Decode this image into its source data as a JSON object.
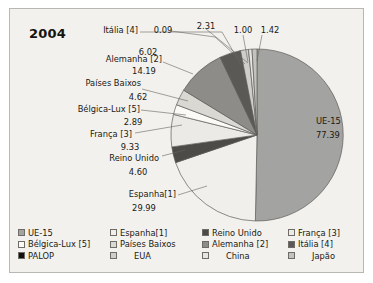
{
  "chart": {
    "title": "2004",
    "background_color": "#f2f1ed",
    "border_color": "#b9b7b2"
  },
  "chart_data": {
    "type": "pie",
    "title": "2004",
    "subtitle": "",
    "xlabel": "",
    "ylabel": "",
    "value_unit": "percent",
    "legend_position": "bottom",
    "grid": false,
    "categories": [
      "UE-15",
      "Espanha[1]",
      "Reino Unido",
      "França [3]",
      "Bélgica-Lux [5]",
      "Países Baixos",
      "Alemanha [2]",
      "Itália [4]",
      "PALOP",
      "EUA",
      "China",
      "Japão"
    ],
    "values": [
      77.39,
      29.99,
      4.6,
      9.33,
      2.89,
      4.62,
      14.19,
      6.02,
      0.09,
      2.31,
      1.0,
      1.42
    ],
    "labels": [
      {
        "name": "UE-15",
        "value": "77.39"
      },
      {
        "name": "Espanha[1]",
        "value": "29.99"
      },
      {
        "name": "Reino Unido",
        "value": "4.60"
      },
      {
        "name": "França [3]",
        "value": "9.33"
      },
      {
        "name": "Bélgica-Lux [5]",
        "value": "2.89"
      },
      {
        "name": "Países Baixos",
        "value": "4.62"
      },
      {
        "name": "Alemanha [2]",
        "value": "14.19"
      },
      {
        "name": "Itália [4]",
        "value": "6.02"
      },
      {
        "name": "PALOP",
        "value": "0.09"
      },
      {
        "name": "EUA",
        "value": "2.31"
      },
      {
        "name": "China",
        "value": "1.00"
      },
      {
        "name": "Japão",
        "value": "1.42"
      }
    ],
    "colors": {
      "UE-15": "#a3a3a1",
      "Espanha[1]": "#f0efeb",
      "Reino Unido": "#4c4b48",
      "França [3]": "#eceae6",
      "Bélgica-Lux [5]": "#fbfaf7",
      "Países Baixos": "#d9d8d3",
      "Alemanha [2]": "#8d8c89",
      "Itália [4]": "#5a5956",
      "PALOP": "#111111",
      "EUA": "#cfcecb",
      "China": "#e6e5e1",
      "Japão": "#c3c2be"
    }
  },
  "callouts": {
    "ue15": {
      "name": "UE-15",
      "value": "77.39"
    },
    "espanha": {
      "name": "Espanha[1]",
      "value": "29.99"
    },
    "reino_unido": {
      "name": "Reino Unido",
      "value": "4.60"
    },
    "franca": {
      "name": "França [3]",
      "value": "9.33"
    },
    "belgica": {
      "name": "Bélgica-Lux [5]",
      "value": "2.89"
    },
    "paises": {
      "name": "Países Baixos",
      "value": "4.62"
    },
    "alemanha": {
      "name": "Alemanha [2]",
      "value": "14.19"
    },
    "italia": {
      "name": "Itália [4]",
      "value": "6.02"
    },
    "palop": {
      "value": "0.09"
    },
    "eua": {
      "value": "2.31"
    },
    "china": {
      "value": "1.00"
    },
    "japao": {
      "value": "1.42"
    }
  },
  "legend": {
    "columns": [
      {
        "items": [
          {
            "label": "UE-15",
            "color": "#a3a3a1",
            "indent": false
          },
          {
            "label": "Bélgica-Lux [5]",
            "color": "#fbfaf7",
            "indent": false
          },
          {
            "label": "PALOP",
            "color": "#111111",
            "indent": false
          }
        ]
      },
      {
        "items": [
          {
            "label": "Espanha[1]",
            "color": "#f0efeb",
            "indent": false
          },
          {
            "label": "Países Baixos",
            "color": "#d9d8d3",
            "indent": false
          },
          {
            "label": "EUA",
            "color": "#cfcecb",
            "indent": true
          }
        ]
      },
      {
        "items": [
          {
            "label": "Reino Unido",
            "color": "#4c4b48",
            "indent": false
          },
          {
            "label": "Alemanha [2]",
            "color": "#8d8c89",
            "indent": false
          },
          {
            "label": "China",
            "color": "#e6e5e1",
            "indent": true
          }
        ]
      },
      {
        "items": [
          {
            "label": "França [3]",
            "color": "#eceae6",
            "indent": false
          },
          {
            "label": "Itália [4]",
            "color": "#5a5956",
            "indent": false
          },
          {
            "label": "Japão",
            "color": "#c3c2be",
            "indent": true
          }
        ]
      }
    ]
  }
}
